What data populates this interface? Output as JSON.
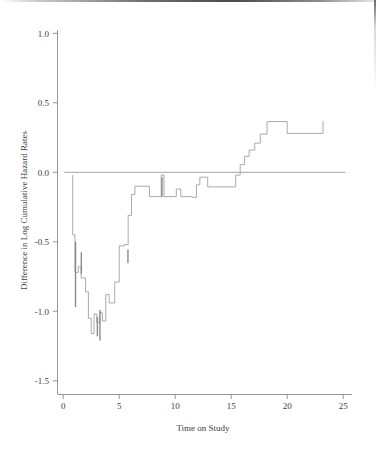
{
  "figure": {
    "background_color": "#ffffff",
    "line_color": "#a0a0a0",
    "axis_color": "#8a8a8a",
    "text_color": "#3d3d3d"
  },
  "axes": {
    "y_title": "Difference in Log Cumulative Hazard Rates",
    "x_title": "Time on Study",
    "y_ticks": [
      "1.0",
      "0.5",
      "0.0",
      "-0.5",
      "-1.0",
      "-1.5"
    ],
    "x_ticks": [
      "0",
      "5",
      "10",
      "15",
      "20",
      "25"
    ]
  },
  "chart_data": {
    "type": "line",
    "title": "",
    "subtitle": "",
    "xlabel": "Time on Study",
    "ylabel": "Difference in Log Cumulative Hazard Rates",
    "xlim": [
      0,
      25.6
    ],
    "ylim": [
      -1.5,
      1.05
    ],
    "grid": false,
    "legend": "none",
    "x_ticks": [
      0,
      5,
      10,
      15,
      20,
      25
    ],
    "y_ticks": [
      -1.5,
      -1.0,
      -0.5,
      0.0,
      0.5,
      1.0
    ],
    "reference_line": {
      "y": 0.0,
      "x_start": 0.1,
      "x_end": 25.2
    },
    "series": [
      {
        "name": "Difference in log cumulative hazard",
        "style": "step-post",
        "x": [
          0.85,
          0.85,
          1.05,
          1.05,
          1.35,
          1.35,
          1.6,
          1.6,
          2.0,
          2.0,
          2.25,
          2.25,
          2.5,
          2.5,
          2.75,
          2.75,
          3.0,
          3.0,
          3.25,
          3.25,
          3.5,
          3.5,
          3.8,
          3.8,
          4.1,
          4.1,
          4.6,
          4.6,
          5.0,
          5.0,
          5.45,
          5.45,
          5.8,
          5.8,
          6.1,
          6.1,
          6.4,
          6.4,
          7.7,
          7.7,
          8.75,
          8.75,
          9.0,
          9.0,
          10.1,
          10.1,
          10.5,
          10.5,
          11.5,
          11.5,
          11.9,
          11.9,
          12.2,
          12.2,
          12.9,
          12.9,
          15.4,
          15.4,
          15.8,
          15.8,
          16.2,
          16.2,
          16.6,
          16.6,
          17.1,
          17.1,
          17.6,
          17.6,
          18.2,
          18.2,
          20.0,
          20.0,
          23.2,
          23.2
        ],
        "y": [
          -0.02,
          -0.45,
          -0.45,
          -0.72,
          -0.72,
          -0.68,
          -0.68,
          -0.76,
          -0.76,
          -0.86,
          -0.86,
          -1.05,
          -1.05,
          -1.16,
          -1.16,
          -1.02,
          -1.02,
          -1.08,
          -1.08,
          -1.01,
          -1.01,
          -1.07,
          -1.07,
          -0.88,
          -0.88,
          -0.94,
          -0.94,
          -0.79,
          -0.79,
          -0.53,
          -0.53,
          -0.52,
          -0.52,
          -0.31,
          -0.31,
          -0.16,
          -0.16,
          -0.1,
          -0.1,
          -0.175,
          -0.175,
          -0.02,
          -0.02,
          -0.175,
          -0.175,
          -0.12,
          -0.12,
          -0.175,
          -0.175,
          -0.18,
          -0.18,
          -0.09,
          -0.09,
          -0.035,
          -0.035,
          -0.105,
          -0.105,
          -0.02,
          -0.02,
          0.055,
          0.055,
          0.115,
          0.115,
          0.16,
          0.16,
          0.21,
          0.21,
          0.275,
          0.275,
          0.365,
          0.365,
          0.28,
          0.28,
          0.37
        ],
        "censor_marks": [
          {
            "x": 1.1,
            "y_top": -0.5,
            "y_bottom": -0.97
          },
          {
            "x": 1.62,
            "y_top": -0.575,
            "y_bottom": -0.73
          },
          {
            "x": 3.28,
            "y_top": -0.99,
            "y_bottom": -1.21
          },
          {
            "x": 3.05,
            "y_top": -1.04,
            "y_bottom": -1.18
          },
          {
            "x": 5.78,
            "y_top": -0.555,
            "y_bottom": -0.655
          },
          {
            "x": 8.82,
            "y_top": -0.035,
            "y_bottom": -0.18
          }
        ]
      }
    ]
  }
}
